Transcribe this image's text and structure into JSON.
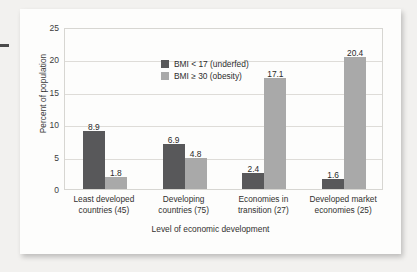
{
  "chart_data": {
    "type": "bar",
    "title": "",
    "xlabel": "Level of economic development",
    "ylabel": "Percent of population",
    "ylim": [
      0,
      25
    ],
    "yticks": [
      0,
      5,
      10,
      15,
      20,
      25
    ],
    "grid": true,
    "legend_position": "inside-top-left",
    "categories": [
      "Least developed countries (45)",
      "Developing countries (75)",
      "Economies in transition (27)",
      "Developed market economies (25)"
    ],
    "category_lines": [
      [
        "Least developed",
        "countries (45)"
      ],
      [
        "Developing",
        "countries (75)"
      ],
      [
        "Economies in",
        "transition (27)"
      ],
      [
        "Developed market",
        "economies (25)"
      ]
    ],
    "series": [
      {
        "name": "BMI < 17 (underfed)",
        "color": "#58585a",
        "values": [
          8.9,
          6.9,
          2.4,
          1.6
        ]
      },
      {
        "name": "BMI ≥ 30 (obesity)",
        "color": "#a9a9a9",
        "values": [
          1.8,
          4.8,
          17.1,
          20.4
        ]
      }
    ]
  },
  "colors": {
    "page_background": "#f2f1ef",
    "card_background": "#fdfdfc",
    "series_dark": "#58585a",
    "series_light": "#a9a9a9",
    "gridline": "#dedcd8",
    "frame": "#d7d6d2",
    "text": "#32312f"
  }
}
